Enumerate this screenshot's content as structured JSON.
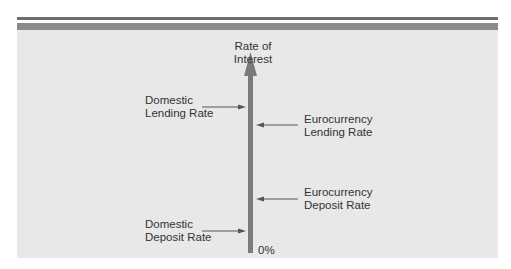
{
  "diagram": {
    "axis": {
      "title_line1": "Rate of",
      "title_line2": "Interest",
      "origin_label": "0%",
      "color": "#7a7a7a"
    },
    "labels": {
      "domestic_lending": {
        "line1": "Domestic",
        "line2": "Lending Rate"
      },
      "eurocurrency_lending": {
        "line1": "Eurocurrency",
        "line2": "Lending Rate"
      },
      "eurocurrency_deposit": {
        "line1": "Eurocurrency",
        "line2": "Deposit Rate"
      },
      "domestic_deposit": {
        "line1": "Domestic",
        "line2": "Deposit Rate"
      }
    },
    "ordering_top_to_bottom": [
      "Domestic Lending Rate",
      "Eurocurrency Lending Rate",
      "Eurocurrency Deposit Rate",
      "Domestic Deposit Rate"
    ],
    "colors": {
      "panel": "#e8e8e8",
      "header_rule": "#8a8a8a",
      "arrow": "#555555",
      "text": "#333333"
    }
  }
}
